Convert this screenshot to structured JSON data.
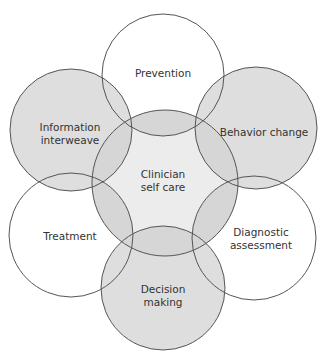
{
  "diagram": {
    "colors": {
      "outline": "#555555",
      "white_fill": "#ffffff",
      "gray_fill": "#dedede",
      "center_fill": "#ececec",
      "text": "#333333"
    },
    "center": {
      "label_line1": "Clinician",
      "label_line2": "self care"
    },
    "nodes": [
      {
        "id": "prevention",
        "label_line1": "Prevention",
        "label_line2": "",
        "fill": "white"
      },
      {
        "id": "behavior-change",
        "label_line1": "Behavior change",
        "label_line2": "",
        "fill": "gray"
      },
      {
        "id": "diagnostic-assessment",
        "label_line1": "Diagnostic",
        "label_line2": "assessment",
        "fill": "white"
      },
      {
        "id": "decision-making",
        "label_line1": "Decision",
        "label_line2": "making",
        "fill": "gray"
      },
      {
        "id": "treatment",
        "label_line1": "Treatment",
        "label_line2": "",
        "fill": "white"
      },
      {
        "id": "information-interweave",
        "label_line1": "Information",
        "label_line2": "interweave",
        "fill": "gray"
      }
    ]
  }
}
